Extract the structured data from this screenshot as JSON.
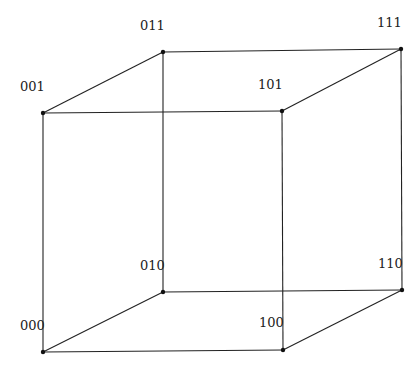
{
  "diagram": {
    "type": "cube-graph",
    "title": "",
    "vertices": [
      {
        "id": "000",
        "label": "000",
        "x": 43,
        "y": 352,
        "lx": 20,
        "ly": 330
      },
      {
        "id": "001",
        "label": "001",
        "x": 43,
        "y": 113,
        "lx": 20,
        "ly": 91
      },
      {
        "id": "010",
        "label": "010",
        "x": 163,
        "y": 292,
        "lx": 140,
        "ly": 270
      },
      {
        "id": "011",
        "label": "011",
        "x": 163,
        "y": 52,
        "lx": 140,
        "ly": 30
      },
      {
        "id": "100",
        "label": "100",
        "x": 283,
        "y": 350,
        "lx": 259,
        "ly": 327
      },
      {
        "id": "101",
        "label": "101",
        "x": 282,
        "y": 111,
        "lx": 258,
        "ly": 89
      },
      {
        "id": "110",
        "label": "110",
        "x": 402,
        "y": 290,
        "lx": 378,
        "ly": 268
      },
      {
        "id": "111",
        "label": "111",
        "x": 401,
        "y": 49,
        "lx": 377,
        "ly": 27
      }
    ],
    "edges": [
      [
        "000",
        "001"
      ],
      [
        "000",
        "010"
      ],
      [
        "000",
        "100"
      ],
      [
        "001",
        "011"
      ],
      [
        "001",
        "101"
      ],
      [
        "010",
        "011"
      ],
      [
        "010",
        "110"
      ],
      [
        "011",
        "111"
      ],
      [
        "100",
        "101"
      ],
      [
        "100",
        "110"
      ],
      [
        "101",
        "111"
      ],
      [
        "110",
        "111"
      ]
    ],
    "colors": {
      "stroke": "#222222",
      "vertex": "#111111",
      "background": "#ffffff"
    }
  }
}
